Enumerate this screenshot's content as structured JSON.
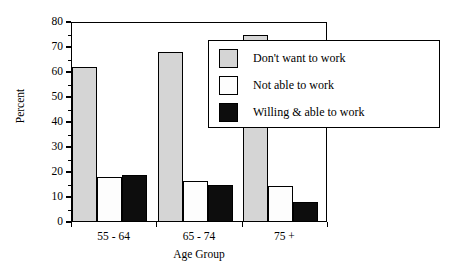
{
  "chart_data": {
    "type": "bar",
    "title": "",
    "xlabel": "Age Group",
    "ylabel": "Percent",
    "categories": [
      "55 - 64",
      "65 - 74",
      "75 +"
    ],
    "series": [
      {
        "name": "Don't want to work",
        "values": [
          62,
          68,
          75
        ],
        "color": "#d5d5d5"
      },
      {
        "name": "Not able to work",
        "values": [
          18,
          16.5,
          14.5
        ],
        "color": "#ffffff"
      },
      {
        "name": "Willing & able to work",
        "values": [
          19,
          15,
          8
        ],
        "color": "#000000"
      }
    ],
    "ylim": [
      0,
      80
    ],
    "yticks": [
      0,
      10,
      20,
      30,
      40,
      50,
      60,
      70,
      80
    ],
    "ytick_labels": [
      "0",
      "10",
      "20",
      "30",
      "40",
      "50",
      "60",
      "70",
      "80"
    ],
    "grid": false,
    "legend_position": "top-right"
  },
  "axes": {
    "y_label": "Percent",
    "x_label": "Age Group",
    "y_ticks": [
      "0",
      "10",
      "20",
      "30",
      "40",
      "50",
      "60",
      "70",
      "80"
    ],
    "x_categories": [
      "55 - 64",
      "65 - 74",
      "75 +"
    ]
  },
  "legend": {
    "entries": [
      {
        "label": "Don't want to work"
      },
      {
        "label": "Not able to work"
      },
      {
        "label": "Willing & able to work"
      }
    ]
  }
}
